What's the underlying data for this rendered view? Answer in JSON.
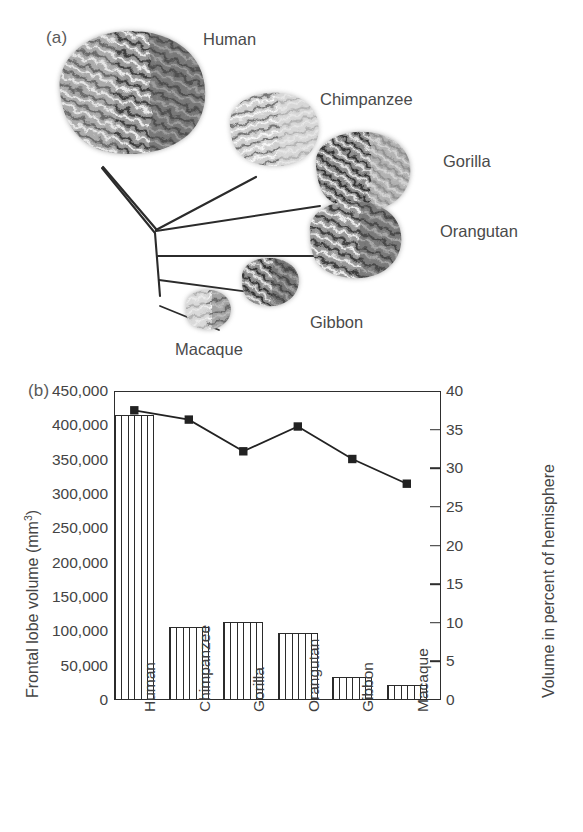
{
  "figure": {
    "panel_a": {
      "label": "(a)",
      "species": [
        {
          "name": "Human"
        },
        {
          "name": "Chimpanzee"
        },
        {
          "name": "Gorilla"
        },
        {
          "name": "Orangutan"
        },
        {
          "name": "Gibbon"
        },
        {
          "name": "Macaque"
        }
      ]
    },
    "panel_b": {
      "label": "(b)"
    }
  },
  "chart_data": {
    "type": "bar",
    "title": "",
    "categories": [
      "Human",
      "Chimpanzee",
      "Gorilla",
      "Orangutan",
      "Gibbon",
      "Macaque"
    ],
    "series": [
      {
        "name": "Frontal lobe volume",
        "type": "bar",
        "axis": "left",
        "values": [
          415000,
          107000,
          113000,
          97000,
          33000,
          22000
        ]
      },
      {
        "name": "Volume in percent of hemisphere",
        "type": "line",
        "axis": "right",
        "marker": "square",
        "values": [
          37.5,
          36.3,
          32.2,
          35.4,
          31.2,
          28.0
        ]
      }
    ],
    "xlabel": "",
    "ylabel": "Frontal lobe volume (mm3)",
    "ylabel_left_prefix": "Frontal lobe volume (mm",
    "ylabel_left_sup": "3",
    "ylabel_left_suffix": ")",
    "ylabel_right": "Volume in percent of hemisphere",
    "ylim": [
      0,
      450000
    ],
    "ylim_right": [
      0,
      40
    ],
    "yticks_left": [
      "0",
      "50,000",
      "100,000",
      "150,000",
      "200,000",
      "250,000",
      "300,000",
      "350,000",
      "400,000",
      "450,000"
    ],
    "yticks_left_values": [
      0,
      50000,
      100000,
      150000,
      200000,
      250000,
      300000,
      350000,
      400000,
      450000
    ],
    "yticks_right": [
      "0",
      "5",
      "10",
      "15",
      "20",
      "25",
      "30",
      "35",
      "40"
    ],
    "yticks_right_values": [
      0,
      5,
      10,
      15,
      20,
      25,
      30,
      35,
      40
    ],
    "grid": false,
    "legend": "none",
    "line_color": "#222222",
    "bar_edge_color": "#2b2b2b"
  }
}
